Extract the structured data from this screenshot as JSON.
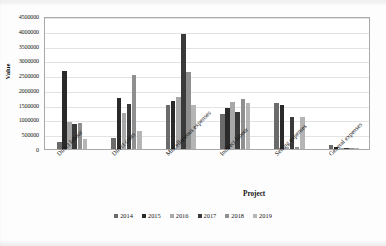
{
  "chart_data": {
    "type": "bar",
    "title": "",
    "xlabel": "Project",
    "ylabel": "Value",
    "ylim": [
      0,
      4500000
    ],
    "ytick_step": 500000,
    "yticks": [
      "0",
      "500000",
      "1000000",
      "1500000",
      "2000000",
      "2500000",
      "3000000",
      "3500000",
      "4000000",
      "4500000"
    ],
    "grid": true,
    "legend_position": "bottom",
    "categories": [
      "Direct labour",
      "Direct costs",
      "Miscellaneous expenses",
      "Indirect labour",
      "Selling expenses",
      "General expenses"
    ],
    "series": [
      {
        "name": "2014",
        "color": "#6b6b6b",
        "values": [
          250000,
          370000,
          1500000,
          1170000,
          1550000,
          130000
        ]
      },
      {
        "name": "2015",
        "color": "#2a2a2a",
        "values": [
          2630000,
          1730000,
          1620000,
          1400000,
          1500000,
          60000
        ]
      },
      {
        "name": "2016",
        "color": "#a8a8a8",
        "values": [
          900000,
          1230000,
          1760000,
          1580000,
          70000,
          30000
        ]
      },
      {
        "name": "2017",
        "color": "#3a3a3a",
        "values": [
          830000,
          1540000,
          3900000,
          1250000,
          1080000,
          20000
        ]
      },
      {
        "name": "2018",
        "color": "#8f8f8f",
        "values": [
          880000,
          2520000,
          2600000,
          1680000,
          70000,
          15000
        ]
      },
      {
        "name": "2019",
        "color": "#b5b5b5",
        "values": [
          330000,
          600000,
          1500000,
          1550000,
          1080000,
          10000
        ]
      }
    ]
  },
  "legend": {
    "items": [
      {
        "label": "2014"
      },
      {
        "label": "2015"
      },
      {
        "label": "2016"
      },
      {
        "label": "2017"
      },
      {
        "label": "2018"
      },
      {
        "label": "2019"
      }
    ]
  }
}
